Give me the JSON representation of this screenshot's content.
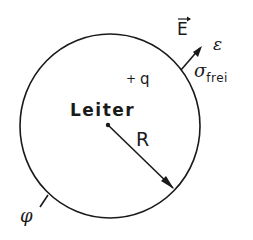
{
  "diagram": {
    "conductor_label": "Leiter",
    "charge_label": "q",
    "charge_sign": "+",
    "radius_label": "R",
    "field_label": "E",
    "field_vector_mark": "→",
    "permittivity_label": "ε",
    "surface_charge_symbol": "σ",
    "surface_charge_subscript": "frei",
    "potential_label": "φ",
    "colors": {
      "stroke": "#1a1a1a",
      "background": "#ffffff"
    }
  }
}
